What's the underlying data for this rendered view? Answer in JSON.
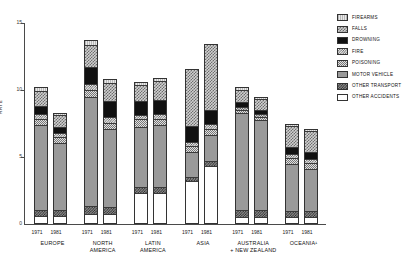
{
  "chart_data": {
    "type": "bar",
    "title": "",
    "xlabel": "",
    "ylabel": "RATE",
    "ylim": [
      0,
      15
    ],
    "yticks": [
      0,
      5,
      10,
      15
    ],
    "ytick_labels": [
      "0",
      "5",
      "10",
      "15"
    ],
    "grid": false,
    "stacked": true,
    "legend_position": "right",
    "categories": [
      "EUROPE 1971",
      "EUROPE 1981",
      "NORTH AMERICA 1971",
      "NORTH AMERICA 1981",
      "LATIN AMERICA 1971",
      "LATIN AMERICA 1981",
      "ASIA 1971",
      "ASIA 1981",
      "AUSTRALIA + NEW ZEALAND 1971",
      "AUSTRALIA + NEW ZEALAND 1981",
      "OCEANIA 1971",
      "OCEANIA 1981"
    ],
    "groups": [
      {
        "name": "EUROPE",
        "bars": [
          {
            "year": "1971",
            "total": 10.2,
            "segments": [
              {
                "label": "OTHER ACCIDENTS",
                "value": 0.55
              },
              {
                "label": "OTHER TRANSPORT",
                "value": 0.45
              },
              {
                "label": "MOTOR VEHICLE",
                "value": 6.45
              },
              {
                "label": "POISONING",
                "value": 0.45
              },
              {
                "label": "FIRE",
                "value": 0.35
              },
              {
                "label": "DROWNING",
                "value": 0.6
              },
              {
                "label": "FALLS",
                "value": 1.15
              },
              {
                "label": "FIREARMS",
                "value": 0.2
              }
            ]
          },
          {
            "year": "1981",
            "total": 8.3,
            "segments": [
              {
                "label": "OTHER ACCIDENTS",
                "value": 0.55
              },
              {
                "label": "OTHER TRANSPORT",
                "value": 0.4
              },
              {
                "label": "MOTOR VEHICLE",
                "value": 5.1
              },
              {
                "label": "POISONING",
                "value": 0.45
              },
              {
                "label": "FIRE",
                "value": 0.35
              },
              {
                "label": "DROWNING",
                "value": 0.45
              },
              {
                "label": "FALLS",
                "value": 0.9
              },
              {
                "label": "FIREARMS",
                "value": 0.1
              }
            ]
          }
        ]
      },
      {
        "name": "NORTH AMERICA",
        "bars": [
          {
            "year": "1971",
            "total": 13.7,
            "segments": [
              {
                "label": "OTHER ACCIDENTS",
                "value": 0.7
              },
              {
                "label": "OTHER TRANSPORT",
                "value": 0.55
              },
              {
                "label": "MOTOR VEHICLE",
                "value": 8.25
              },
              {
                "label": "POISONING",
                "value": 0.55
              },
              {
                "label": "FIRE",
                "value": 0.45
              },
              {
                "label": "DROWNING",
                "value": 1.25
              },
              {
                "label": "FALLS",
                "value": 1.65
              },
              {
                "label": "FIREARMS",
                "value": 0.3
              }
            ]
          },
          {
            "year": "1981",
            "total": 10.8,
            "segments": [
              {
                "label": "OTHER ACCIDENTS",
                "value": 0.65
              },
              {
                "label": "OTHER TRANSPORT",
                "value": 0.55
              },
              {
                "label": "MOTOR VEHICLE",
                "value": 5.95
              },
              {
                "label": "POISONING",
                "value": 0.45
              },
              {
                "label": "FIRE",
                "value": 0.4
              },
              {
                "label": "DROWNING",
                "value": 1.25
              },
              {
                "label": "FALLS",
                "value": 1.35
              },
              {
                "label": "FIREARMS",
                "value": 0.2
              }
            ]
          }
        ]
      },
      {
        "name": "LATIN AMERICA",
        "bars": [
          {
            "year": "1971",
            "total": 10.6,
            "segments": [
              {
                "label": "OTHER ACCIDENTS",
                "value": 2.3
              },
              {
                "label": "OTHER TRANSPORT",
                "value": 0.45
              },
              {
                "label": "MOTOR VEHICLE",
                "value": 4.55
              },
              {
                "label": "POISONING",
                "value": 0.55
              },
              {
                "label": "FIRE",
                "value": 0.35
              },
              {
                "label": "DROWNING",
                "value": 1.0
              },
              {
                "label": "FALLS",
                "value": 1.25
              },
              {
                "label": "FIREARMS",
                "value": 0.15
              }
            ]
          },
          {
            "year": "1981",
            "total": 10.9,
            "segments": [
              {
                "label": "OTHER ACCIDENTS",
                "value": 2.25
              },
              {
                "label": "OTHER TRANSPORT",
                "value": 0.45
              },
              {
                "label": "MOTOR VEHICLE",
                "value": 4.7
              },
              {
                "label": "POISONING",
                "value": 0.5
              },
              {
                "label": "FIRE",
                "value": 0.35
              },
              {
                "label": "DROWNING",
                "value": 1.05
              },
              {
                "label": "FALLS",
                "value": 1.45
              },
              {
                "label": "FIREARMS",
                "value": 0.15
              }
            ]
          }
        ]
      },
      {
        "name": "ASIA",
        "bars": [
          {
            "year": "1971",
            "total": 11.6,
            "segments": [
              {
                "label": "OTHER ACCIDENTS",
                "value": 3.15
              },
              {
                "label": "OTHER TRANSPORT",
                "value": 0.35
              },
              {
                "label": "MOTOR VEHICLE",
                "value": 1.85
              },
              {
                "label": "POISONING",
                "value": 0.45
              },
              {
                "label": "FIRE",
                "value": 0.35
              },
              {
                "label": "DROWNING",
                "value": 1.2
              },
              {
                "label": "FALLS",
                "value": 4.25
              },
              {
                "label": "FIREARMS",
                "value": 0.0
              }
            ]
          },
          {
            "year": "1981",
            "total": 13.4,
            "segments": [
              {
                "label": "OTHER ACCIDENTS",
                "value": 4.3
              },
              {
                "label": "OTHER TRANSPORT",
                "value": 0.35
              },
              {
                "label": "MOTOR VEHICLE",
                "value": 2.0
              },
              {
                "label": "POISONING",
                "value": 0.45
              },
              {
                "label": "FIRE",
                "value": 0.35
              },
              {
                "label": "DROWNING",
                "value": 1.05
              },
              {
                "label": "FALLS",
                "value": 4.9
              },
              {
                "label": "FIREARMS",
                "value": 0.0
              }
            ]
          }
        ]
      },
      {
        "name": "AUSTRALIA + NEW ZEALAND",
        "bars": [
          {
            "year": "1971",
            "total": 10.2,
            "segments": [
              {
                "label": "OTHER ACCIDENTS",
                "value": 0.45
              },
              {
                "label": "OTHER TRANSPORT",
                "value": 0.5
              },
              {
                "label": "MOTOR VEHICLE",
                "value": 7.35
              },
              {
                "label": "POISONING",
                "value": 0.25
              },
              {
                "label": "FIRE",
                "value": 0.2
              },
              {
                "label": "DROWNING",
                "value": 0.4
              },
              {
                "label": "FALLS",
                "value": 0.95
              },
              {
                "label": "FIREARMS",
                "value": 0.1
              }
            ]
          },
          {
            "year": "1981",
            "total": 9.5,
            "segments": [
              {
                "label": "OTHER ACCIDENTS",
                "value": 0.45
              },
              {
                "label": "OTHER TRANSPORT",
                "value": 0.55
              },
              {
                "label": "MOTOR VEHICLE",
                "value": 6.8
              },
              {
                "label": "POISONING",
                "value": 0.25
              },
              {
                "label": "FIRE",
                "value": 0.2
              },
              {
                "label": "DROWNING",
                "value": 0.35
              },
              {
                "label": "FALLS",
                "value": 0.8
              },
              {
                "label": "FIREARMS",
                "value": 0.1
              }
            ]
          }
        ]
      },
      {
        "name": "OCEANIA",
        "bars": [
          {
            "year": "1971",
            "total": 7.5,
            "segments": [
              {
                "label": "OTHER ACCIDENTS",
                "value": 0.45
              },
              {
                "label": "OTHER TRANSPORT",
                "value": 0.45
              },
              {
                "label": "MOTOR VEHICLE",
                "value": 3.6
              },
              {
                "label": "POISONING",
                "value": 0.45
              },
              {
                "label": "FIRE",
                "value": 0.3
              },
              {
                "label": "DROWNING",
                "value": 0.5
              },
              {
                "label": "FALLS",
                "value": 1.65
              },
              {
                "label": "FIREARMS",
                "value": 0.1
              }
            ]
          },
          {
            "year": "1981",
            "total": 7.1,
            "segments": [
              {
                "label": "OTHER ACCIDENTS",
                "value": 0.45
              },
              {
                "label": "OTHER TRANSPORT",
                "value": 0.45
              },
              {
                "label": "MOTOR VEHICLE",
                "value": 3.2
              },
              {
                "label": "POISONING",
                "value": 0.45
              },
              {
                "label": "FIRE",
                "value": 0.3
              },
              {
                "label": "DROWNING",
                "value": 0.55
              },
              {
                "label": "FALLS",
                "value": 1.6
              },
              {
                "label": "FIREARMS",
                "value": 0.1
              }
            ]
          }
        ]
      }
    ],
    "legend": [
      {
        "label": "FIREARMS",
        "key": "firearms"
      },
      {
        "label": "FALLS",
        "key": "falls"
      },
      {
        "label": "DROWNING",
        "key": "drowning"
      },
      {
        "label": "FIRE",
        "key": "fire"
      },
      {
        "label": "POISONING",
        "key": "poisoning"
      },
      {
        "label": "MOTOR VEHICLE",
        "key": "motor"
      },
      {
        "label": "OTHER TRANSPORT",
        "key": "othertransport"
      },
      {
        "label": "OTHER ACCIDENTS",
        "key": "otheraccidents"
      }
    ],
    "group_label_lines": [
      [
        "EUROPE"
      ],
      [
        "NORTH",
        "AMERICA"
      ],
      [
        "LATIN",
        "AMERICA"
      ],
      [
        "ASIA"
      ],
      [
        "AUSTRALIA",
        "+ NEW ZEALAND"
      ],
      [
        "OCEANIA¹"
      ]
    ]
  }
}
